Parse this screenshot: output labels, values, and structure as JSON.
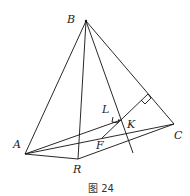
{
  "figure": {
    "caption": "图 24",
    "points": {
      "B": {
        "label": "B",
        "x": 86,
        "y": 21
      },
      "A": {
        "label": "A",
        "x": 25,
        "y": 154
      },
      "R": {
        "label": "R",
        "x": 78,
        "y": 159
      },
      "C": {
        "label": "C",
        "x": 174,
        "y": 124
      },
      "F": {
        "label": "F",
        "x": 102,
        "y": 138
      },
      "K": {
        "label": "K",
        "x": 121,
        "y": 121
      },
      "L": {
        "label": "L"
      }
    },
    "segments": [
      "BA",
      "BR",
      "BC",
      "BK-extended",
      "AR",
      "RC",
      "AC",
      "AK",
      "FK-to-BC",
      "AF"
    ],
    "right_angles": [
      "at L on line BK",
      "at foot of perpendicular on BC"
    ]
  }
}
